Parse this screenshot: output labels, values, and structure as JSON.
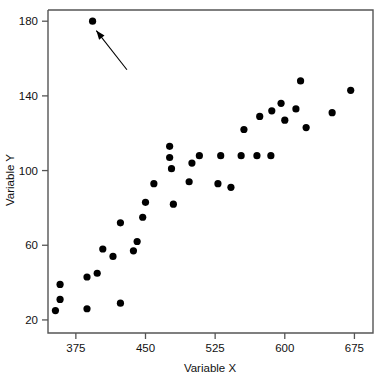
{
  "chart_data": {
    "type": "scatter",
    "title": "",
    "xlabel": "Variable X",
    "ylabel": "Variable Y",
    "xlim": [
      345,
      695
    ],
    "ylim": [
      13,
      186
    ],
    "xticks": [
      375,
      450,
      525,
      600,
      675
    ],
    "yticks": [
      20,
      60,
      100,
      140,
      180
    ],
    "xtick_labels": [
      "375",
      "450",
      "525",
      "600",
      "675"
    ],
    "ytick_labels": [
      "20",
      "60",
      "100",
      "140",
      "180"
    ],
    "grid": false,
    "legend": null,
    "marker": {
      "shape": "circle",
      "color": "#000000",
      "size": 4.6
    },
    "series": [
      {
        "name": "observations",
        "points": [
          {
            "x": 353,
            "y": 25
          },
          {
            "x": 358,
            "y": 31
          },
          {
            "x": 358,
            "y": 39
          },
          {
            "x": 387,
            "y": 26
          },
          {
            "x": 387,
            "y": 43
          },
          {
            "x": 398,
            "y": 45
          },
          {
            "x": 404,
            "y": 58
          },
          {
            "x": 393,
            "y": 180
          },
          {
            "x": 415,
            "y": 54
          },
          {
            "x": 423,
            "y": 29
          },
          {
            "x": 423,
            "y": 72
          },
          {
            "x": 437,
            "y": 57
          },
          {
            "x": 441,
            "y": 62
          },
          {
            "x": 447,
            "y": 75
          },
          {
            "x": 450,
            "y": 83
          },
          {
            "x": 459,
            "y": 93
          },
          {
            "x": 478,
            "y": 101
          },
          {
            "x": 480,
            "y": 82
          },
          {
            "x": 476,
            "y": 113
          },
          {
            "x": 476,
            "y": 107
          },
          {
            "x": 497,
            "y": 94
          },
          {
            "x": 500,
            "y": 104
          },
          {
            "x": 508,
            "y": 108
          },
          {
            "x": 528,
            "y": 93
          },
          {
            "x": 531,
            "y": 108
          },
          {
            "x": 542,
            "y": 91
          },
          {
            "x": 553,
            "y": 108
          },
          {
            "x": 556,
            "y": 122
          },
          {
            "x": 570,
            "y": 108
          },
          {
            "x": 573,
            "y": 129
          },
          {
            "x": 585,
            "y": 108
          },
          {
            "x": 586,
            "y": 132
          },
          {
            "x": 596,
            "y": 136
          },
          {
            "x": 600,
            "y": 127
          },
          {
            "x": 612,
            "y": 133
          },
          {
            "x": 617,
            "y": 148
          },
          {
            "x": 623,
            "y": 123
          },
          {
            "x": 651,
            "y": 131
          },
          {
            "x": 671,
            "y": 143
          }
        ]
      }
    ],
    "annotations": [
      {
        "type": "arrow",
        "label": "",
        "tail": {
          "x": 430,
          "y": 154
        },
        "head": {
          "x": 397,
          "y": 175
        },
        "note": "arrow pointing at outlier observation near (393, 180)"
      }
    ]
  },
  "axes": {
    "x_title": "Variable X",
    "y_title": "Variable Y"
  }
}
